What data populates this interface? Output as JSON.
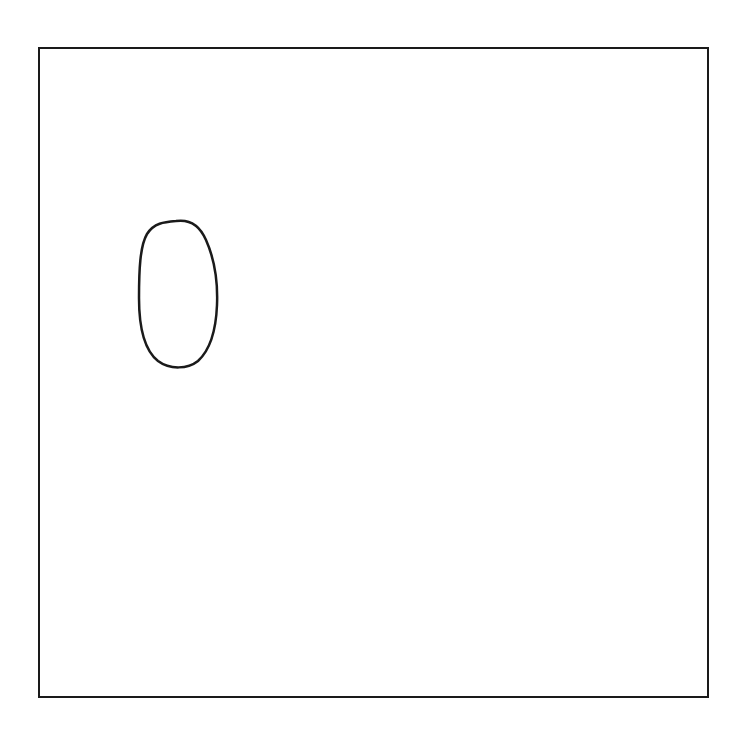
{
  "diagram": {
    "background": "#ffffff",
    "stroke_color": "#1a1a1a",
    "frame": {
      "x": 39,
      "y": 48,
      "width": 669,
      "height": 649,
      "stroke_width": 2
    },
    "shapes": [
      {
        "type": "oval",
        "label": "",
        "cx": 178,
        "cy": 294,
        "rx": 39,
        "ry": 73,
        "stroke_width": 2.5
      }
    ]
  }
}
